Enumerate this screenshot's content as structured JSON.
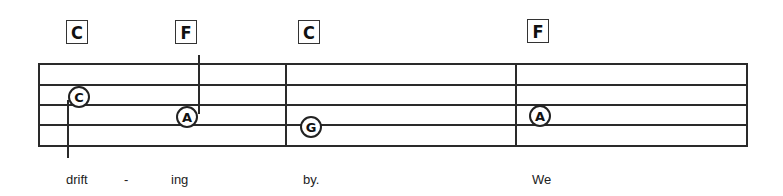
{
  "chords": [
    {
      "label": "C",
      "x": 66,
      "y": 20
    },
    {
      "label": "F",
      "x": 175,
      "y": 20
    },
    {
      "label": "C",
      "x": 298,
      "y": 20
    },
    {
      "label": "F",
      "x": 527,
      "y": 19
    }
  ],
  "staff": {
    "left": 38,
    "right": 747,
    "lines_y": [
      64,
      85,
      105,
      125,
      146
    ],
    "barlines_x": [
      38,
      286,
      516,
      746
    ]
  },
  "notes": [
    {
      "letter": "C",
      "cx": 79,
      "cy": 97,
      "stem": {
        "x": 68,
        "y1": 100,
        "y2": 158
      }
    },
    {
      "letter": "A",
      "cx": 187,
      "cy": 117,
      "stem": {
        "x": 198,
        "y1": 55,
        "y2": 114
      }
    },
    {
      "letter": "G",
      "cx": 311,
      "cy": 127
    },
    {
      "letter": "A",
      "cx": 540,
      "cy": 116
    }
  ],
  "lyrics": [
    {
      "text": "drift",
      "x": 66
    },
    {
      "text": "-",
      "x": 124
    },
    {
      "text": "ing",
      "x": 171
    },
    {
      "text": "by.",
      "x": 303
    },
    {
      "text": "We",
      "x": 532
    }
  ]
}
